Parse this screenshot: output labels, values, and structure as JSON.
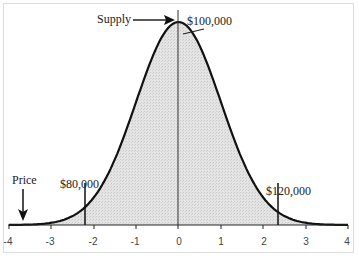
{
  "chart_data": {
    "type": "area",
    "title": "",
    "xlabel": "",
    "ylabel": "",
    "xlim": [
      -4,
      4
    ],
    "x_ticks": [
      "-4",
      "-3",
      "-2",
      "-1",
      "0",
      "1",
      "2",
      "3",
      "4"
    ],
    "grid": false,
    "legend": "none",
    "series": [
      {
        "name": "Normal distribution (standard normal density)",
        "mean": 0,
        "sd": 1,
        "shaded_region": [
          -4,
          4
        ]
      }
    ],
    "markers": [
      {
        "x": -2.2,
        "label": "$80,000"
      },
      {
        "x": 0,
        "label": "$100,000"
      },
      {
        "x": 2.35,
        "label": "$120,000"
      }
    ],
    "annotations": [
      {
        "text": "Supply",
        "type": "arrow",
        "points_to": "peak of curve"
      },
      {
        "text": "Price",
        "type": "arrow",
        "points_to": "x-axis near -3.6"
      },
      {
        "text": "$100,000",
        "type": "leader-line",
        "points_to": "peak of curve"
      }
    ]
  },
  "labels": {
    "supply": "Supply",
    "price": "Price",
    "low": "$80,000",
    "mid": "$100,000",
    "high": "$120,000"
  },
  "ticks": [
    "-4",
    "-3",
    "-2",
    "-1",
    "0",
    "1",
    "2",
    "3",
    "4"
  ]
}
